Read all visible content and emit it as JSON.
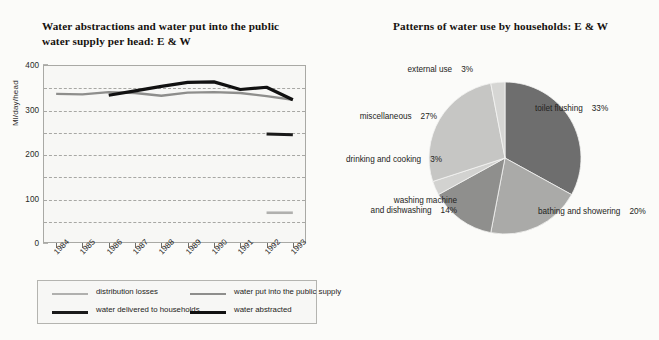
{
  "left": {
    "title": "Water abstractions and water put into the public water supply per head: E & W",
    "y_axis_label": "Ml/day/head",
    "legend": [
      {
        "label": "distribution losses",
        "color": "#b0b0ae",
        "thickness": 2
      },
      {
        "label": "water put into the public supply",
        "color": "#8e8e8c",
        "thickness": 2.5
      },
      {
        "label": "water delivered to households",
        "color": "#1a1a1a",
        "thickness": 3
      },
      {
        "label": "water abstracted",
        "color": "#111111",
        "thickness": 3.5
      }
    ]
  },
  "right": {
    "title": "Patterns of water use by households: E & W"
  },
  "chart_data": [
    {
      "type": "line",
      "title": "Water abstractions and water put into the public water supply per head: E & W",
      "xlabel": "",
      "ylabel": "Ml/day/head",
      "ylim": [
        0,
        400
      ],
      "yticks": [
        0,
        100,
        200,
        300,
        400
      ],
      "gridlines": [
        50,
        100,
        150,
        200,
        250,
        300,
        350
      ],
      "grid": true,
      "legend_position": "below",
      "categories": [
        "1984",
        "1985",
        "1986",
        "1987",
        "1988",
        "1989",
        "1990",
        "1991",
        "1992",
        "1993"
      ],
      "series": [
        {
          "name": "water put into the public supply",
          "color": "#8e8e8c",
          "values": [
            335,
            334,
            339,
            337,
            331,
            338,
            339,
            337,
            330,
            322
          ]
        },
        {
          "name": "water abstracted",
          "color": "#111111",
          "values": [
            null,
            null,
            332,
            342,
            352,
            361,
            362,
            345,
            350,
            322
          ]
        },
        {
          "name": "water delivered to households",
          "color": "#1a1a1a",
          "values": [
            null,
            null,
            null,
            null,
            null,
            null,
            null,
            null,
            245,
            243
          ]
        },
        {
          "name": "distribution losses",
          "color": "#b0b0ae",
          "values": [
            null,
            null,
            null,
            null,
            null,
            null,
            null,
            null,
            68,
            68
          ]
        }
      ]
    },
    {
      "type": "pie",
      "title": "Patterns of water use by households: E & W",
      "labels": [
        "toilet flushing",
        "bathing and showering",
        "washing machine and dishwashing",
        "drinking and cooking",
        "miscellaneous",
        "external use"
      ],
      "values": [
        33,
        20,
        14,
        3,
        27,
        3
      ],
      "value_labels": [
        "33%",
        "20%",
        "14%",
        "3%",
        "3%",
        "27%"
      ],
      "colors": [
        "#6e6e6e",
        "#aaaaa8",
        "#8f8f8d",
        "#d2d2d0",
        "#c6c6c4",
        "#d6d6d4"
      ],
      "start_angle_deg": 0,
      "direction": "clockwise"
    }
  ],
  "pie_labels": [
    {
      "name": "toilet flushing",
      "pct": "33%",
      "side": "r",
      "x": 190,
      "y": 104
    },
    {
      "name": "bathing and showering",
      "pct": "20%",
      "side": "r",
      "x": 193,
      "y": 207
    },
    {
      "name": "washing machine and dishwashing",
      "pct": "14%",
      "side": "l",
      "x": 112,
      "y": 196
    },
    {
      "name": "drinking and cooking",
      "pct": "3%",
      "side": "l",
      "x": 97,
      "y": 155
    },
    {
      "name": "miscellaneous",
      "pct": "27%",
      "side": "l",
      "x": 92,
      "y": 112
    },
    {
      "name": "external use",
      "pct": "3%",
      "side": "l",
      "x": 128,
      "y": 65
    }
  ]
}
